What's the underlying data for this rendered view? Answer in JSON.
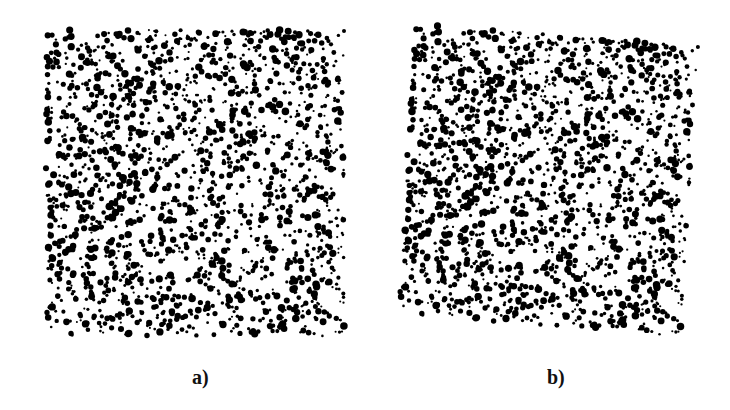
{
  "figure": {
    "panels": [
      {
        "id": "a",
        "label": "a)",
        "description": "random speckle dot pattern (reference)"
      },
      {
        "id": "b",
        "label": "b)",
        "description": "random speckle dot pattern (rotated/deformed)"
      }
    ],
    "colors": {
      "background": "#ffffff",
      "dots": "#000000"
    }
  }
}
